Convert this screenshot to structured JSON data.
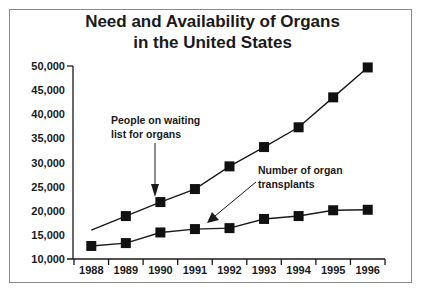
{
  "chart_data": {
    "type": "line",
    "title": "Need and Availability of Organs in the United States",
    "title_lines": [
      "Need and Availability of Organs",
      "in the United States"
    ],
    "xlabel": "",
    "ylabel": "",
    "categories": [
      "1988",
      "1989",
      "1990",
      "1991",
      "1992",
      "1993",
      "1994",
      "1995",
      "1996"
    ],
    "ylim": [
      10000,
      50000
    ],
    "yticks": [
      10000,
      15000,
      20000,
      25000,
      30000,
      35000,
      40000,
      45000,
      50000
    ],
    "ytick_labels": [
      "10,000",
      "15,000",
      "20,000",
      "25,000",
      "30,000",
      "35,000",
      "40,000",
      "45,000",
      "50,000"
    ],
    "grid": false,
    "legend": "none (inline annotations with arrows)",
    "series": [
      {
        "name": "People on waiting list for organs",
        "annotation_lines": [
          "People on waiting",
          "list for organs"
        ],
        "values": [
          16000,
          18900,
          21800,
          24500,
          29200,
          33200,
          37300,
          43500,
          49700
        ],
        "markers": [
          false,
          true,
          true,
          true,
          true,
          true,
          true,
          true,
          true
        ]
      },
      {
        "name": "Number of organ transplants",
        "annotation_lines": [
          "Number of organ",
          "transplants"
        ],
        "values": [
          12700,
          13300,
          15500,
          16200,
          16400,
          18300,
          18900,
          20100,
          20200
        ],
        "markers": [
          true,
          true,
          true,
          true,
          true,
          true,
          true,
          true,
          true
        ]
      }
    ]
  }
}
